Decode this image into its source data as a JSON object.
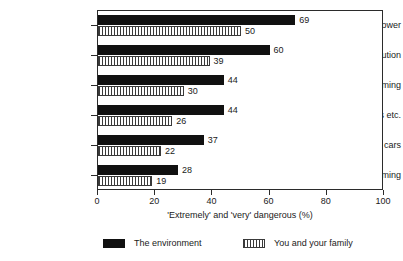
{
  "chart_data": {
    "type": "bar",
    "orientation": "horizontal",
    "title": "",
    "xlabel": "'Extremely' and 'very' dangerous (%)",
    "ylabel": "",
    "xlim": [
      0,
      100
    ],
    "xticks": [
      "0",
      "20",
      "40",
      "60",
      "80",
      "100"
    ],
    "grid": false,
    "legend_position": "bottom",
    "categories": [
      "Nuclear power",
      "Air pollution",
      "Global warming",
      "Polluted rivers etc.",
      "Pollution from cars",
      "Chemicals, farming"
    ],
    "series": [
      {
        "name": "The environment",
        "fill": "solid-black",
        "color": "#111111",
        "values": [
          69,
          60,
          44,
          44,
          37,
          28
        ]
      },
      {
        "name": "You and your family",
        "fill": "vertical-hatch",
        "color": "#3a3a3a",
        "values": [
          50,
          39,
          30,
          26,
          22,
          19
        ]
      }
    ]
  },
  "axis": {
    "x_title": "'Extremely' and 'very' dangerous (%)",
    "ticks": [
      "0",
      "20",
      "40",
      "60",
      "80",
      "100"
    ]
  },
  "legend": {
    "items": [
      {
        "label": "The environment"
      },
      {
        "label": "You and your family"
      }
    ]
  }
}
